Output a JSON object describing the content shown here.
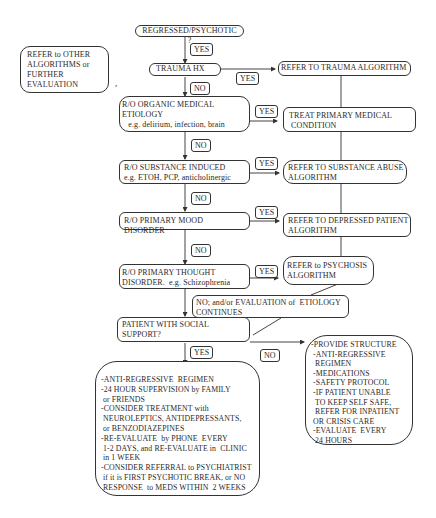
{
  "flowchart": {
    "start": "REGRESSED/PSYCHOTIC ?",
    "refer_other": [
      "REFER to OTHER",
      "ALGORITHMS or",
      "FURTHER",
      "EVALUATION"
    ],
    "trauma_hx": "TRAUMA HX",
    "refer_trauma": "REFER TO TRAUMA ALGORITHM",
    "organic": [
      "R/O ORGANIC MEDICAL",
      "ETIOLOGY",
      "   e.g. delirium, infection, brain"
    ],
    "treat_medical": [
      "TREAT PRIMARY MEDICAL",
      " CONDITION"
    ],
    "substance": [
      "R/O SUBSTANCE INDUCED",
      "e.g. ETOH, PCP, anticholinergic"
    ],
    "refer_substance": [
      "REFER TO SUBSTANCE ABUSE",
      "ALGORITHM"
    ],
    "mood": "R/O PRIMARY MOOD DISORDER",
    "refer_depressed": [
      "REFER TO DEPRESSED PATIENT",
      "ALGORITHM"
    ],
    "thought": [
      "R/O PRIMARY THOUGHT",
      "DISORDER.  e.g. Schizophrenia"
    ],
    "refer_psychosis": [
      "REFER to PSYCHOSIS",
      "ALGORITHM"
    ],
    "no_continues": [
      "NO; and/or EVALUATION of  ETIOLOGY",
      "CONTINUES"
    ],
    "social_support": [
      "PATIENT WITH SOCIAL",
      "SUPPORT?"
    ],
    "yes_plan": [
      "-ANTI-REGRESSIVE  REGIMEN",
      "-24 HOUR SUPERVISION by FAMILY",
      " or FRIENDS",
      "-CONSIDER TREATMENT with",
      " NEUROLEPTICS, ANTIDEPRESSANTS,",
      " or BENZODIAZEPINES",
      "-RE-EVALUATE  by PHONE  EVERY",
      " 1-2 DAYS, and RE-EVALUATE in  CLINIC",
      " in 1 WEEK",
      "-CONSIDER REFERRAL to PSYCHIATRIST",
      " if it is FIRST PSYCHOTIC BREAK, or NO",
      " RESPONSE  to MEDS WITHIN  2 WEEKS"
    ],
    "no_plan": [
      "-PROVIDE STRUCTURE",
      " -ANTI-REGRESSIVE",
      "  REGIMEN",
      " -MEDICATIONS",
      " -SAFETY PROTOCOL",
      " -IF PATIENT UNABLE",
      "  TO KEEP SELF SAFE,",
      "  REFER FOR INPATIENT",
      " OR CRISIS CARE",
      " -EVALUATE  EVERY",
      "  24 HOURS"
    ],
    "labels": {
      "yes": "YES",
      "no": "NO"
    },
    "stray_mark": ","
  }
}
